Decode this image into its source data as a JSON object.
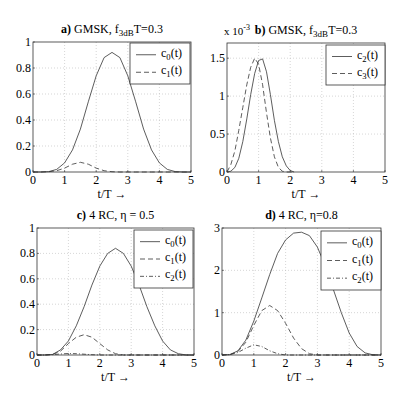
{
  "chart_data": [
    {
      "id": "a",
      "type": "line",
      "title_prefix": "a)",
      "title": "GMSK,  f",
      "title_sub": "3dB",
      "title_suffix": "T=0.3",
      "xlabel": "t/T  →",
      "ylabel": "",
      "xlim": [
        0,
        5
      ],
      "ylim": [
        0,
        1
      ],
      "xticks": [
        0,
        1,
        2,
        3,
        4,
        5
      ],
      "yticks": [
        0,
        0.2,
        0.4,
        0.6,
        0.8,
        1
      ],
      "ytick_labels": [
        "0",
        "0.2",
        "0.4",
        "0.6",
        "0.8",
        "1"
      ],
      "y_multiplier": "",
      "grid": true,
      "legend_position": "upper right",
      "x": [
        0,
        0.25,
        0.5,
        0.75,
        1.0,
        1.25,
        1.5,
        1.75,
        2.0,
        2.25,
        2.5,
        2.75,
        3.0,
        3.25,
        3.5,
        3.75,
        4.0,
        4.25,
        4.5,
        4.75,
        5.0
      ],
      "series": [
        {
          "name": "c",
          "sub": "0",
          "suffix": "(t)",
          "style": "solid",
          "values": [
            0,
            0.0,
            0.003,
            0.02,
            0.07,
            0.17,
            0.33,
            0.54,
            0.74,
            0.88,
            0.92,
            0.88,
            0.74,
            0.54,
            0.33,
            0.17,
            0.07,
            0.02,
            0.003,
            0.0,
            0
          ]
        },
        {
          "name": "c",
          "sub": "1",
          "suffix": "(t)",
          "style": "dashed",
          "values": [
            0,
            0.0,
            0.002,
            0.01,
            0.03,
            0.06,
            0.075,
            0.06,
            0.03,
            0.01,
            0.002,
            0.0,
            0,
            0,
            0,
            0,
            0,
            0,
            0,
            0,
            0
          ]
        }
      ]
    },
    {
      "id": "b",
      "type": "line",
      "title_prefix": "b)",
      "title": "GMSK,  f",
      "title_sub": "3dB",
      "title_suffix": "T=0.3",
      "xlabel": "t/T  →",
      "ylabel": "",
      "xlim": [
        0,
        5
      ],
      "ylim": [
        0,
        1.7
      ],
      "xticks": [
        0,
        1,
        2,
        3,
        4,
        5
      ],
      "yticks": [
        0,
        0.5,
        1,
        1.5
      ],
      "ytick_labels": [
        "0",
        "0.5",
        "1",
        "1.5"
      ],
      "y_multiplier": "x 10",
      "y_multiplier_exp": "-3",
      "grid": true,
      "legend_position": "upper right",
      "x": [
        0,
        0.125,
        0.25,
        0.375,
        0.5,
        0.625,
        0.75,
        0.875,
        1.0,
        1.125,
        1.25,
        1.375,
        1.5,
        1.625,
        1.75,
        1.875,
        2.0,
        2.125
      ],
      "series": [
        {
          "name": "c",
          "sub": "2",
          "suffix": "(t)",
          "style": "solid",
          "values": [
            0,
            0.01,
            0.06,
            0.18,
            0.4,
            0.7,
            1.02,
            1.3,
            1.47,
            1.49,
            1.32,
            1.02,
            0.68,
            0.4,
            0.2,
            0.08,
            0.02,
            0
          ]
        },
        {
          "name": "c",
          "sub": "3",
          "suffix": "(t)",
          "style": "dashed",
          "values": [
            0,
            0.1,
            0.28,
            0.55,
            0.85,
            1.15,
            1.38,
            1.5,
            1.42,
            1.15,
            0.78,
            0.45,
            0.2,
            0.06,
            0.01,
            0,
            0,
            0
          ]
        }
      ]
    },
    {
      "id": "c",
      "type": "line",
      "title_prefix": "c)",
      "title": "4 RC,  η = 0.5",
      "title_sub": "",
      "title_suffix": "",
      "xlabel": "t/T  →",
      "ylabel": "",
      "xlim": [
        0,
        5
      ],
      "ylim": [
        0,
        1
      ],
      "xticks": [
        0,
        1,
        2,
        3,
        4,
        5
      ],
      "yticks": [
        0,
        0.2,
        0.4,
        0.6,
        0.8,
        1
      ],
      "ytick_labels": [
        "0",
        "0.2",
        "0.4",
        "0.6",
        "0.8",
        "1"
      ],
      "y_multiplier": "",
      "grid": true,
      "legend_position": "upper right",
      "x": [
        0,
        0.25,
        0.5,
        0.75,
        1.0,
        1.25,
        1.5,
        1.75,
        2.0,
        2.25,
        2.5,
        2.75,
        3.0,
        3.25,
        3.5,
        3.75,
        4.0,
        4.25,
        4.5,
        4.75,
        5.0
      ],
      "series": [
        {
          "name": "c",
          "sub": "0",
          "suffix": "(t)",
          "style": "solid",
          "values": [
            0,
            0.0,
            0.005,
            0.04,
            0.11,
            0.23,
            0.38,
            0.55,
            0.7,
            0.8,
            0.84,
            0.8,
            0.7,
            0.55,
            0.38,
            0.23,
            0.11,
            0.04,
            0.01,
            0.0,
            0
          ]
        },
        {
          "name": "c",
          "sub": "1",
          "suffix": "(t)",
          "style": "dashed",
          "values": [
            0,
            0.0,
            0.005,
            0.03,
            0.09,
            0.14,
            0.16,
            0.14,
            0.09,
            0.04,
            0.01,
            0.0,
            0,
            0,
            0,
            0,
            0,
            0,
            0,
            0,
            0
          ]
        },
        {
          "name": "c",
          "sub": "2",
          "suffix": "(t)",
          "style": "dashdot",
          "values": [
            0,
            0.0,
            0.003,
            0.008,
            0.012,
            0.01,
            0.006,
            0.002,
            0.0,
            0,
            0,
            0,
            0,
            0,
            0,
            0,
            0,
            0,
            0,
            0,
            0
          ]
        }
      ]
    },
    {
      "id": "d",
      "type": "line",
      "title_prefix": "d)",
      "title": "4 RC,  η=0.8",
      "title_sub": "",
      "title_suffix": "",
      "xlabel": "t/T  →",
      "ylabel": "",
      "xlim": [
        0,
        5
      ],
      "ylim": [
        0,
        3
      ],
      "xticks": [
        0,
        1,
        2,
        3,
        4,
        5
      ],
      "yticks": [
        0,
        1,
        2,
        3
      ],
      "ytick_labels": [
        "0",
        "1",
        "2",
        "3"
      ],
      "y_multiplier": "",
      "grid": true,
      "legend_position": "upper right",
      "x": [
        0,
        0.25,
        0.5,
        0.75,
        1.0,
        1.25,
        1.5,
        1.75,
        2.0,
        2.25,
        2.5,
        2.75,
        3.0,
        3.25,
        3.5,
        3.75,
        4.0,
        4.25,
        4.5,
        4.75,
        5.0
      ],
      "series": [
        {
          "name": "c",
          "sub": "0",
          "suffix": "(t)",
          "style": "solid",
          "values": [
            0,
            0.01,
            0.1,
            0.35,
            0.8,
            1.35,
            1.9,
            2.4,
            2.72,
            2.88,
            2.9,
            2.82,
            2.55,
            2.1,
            1.55,
            1.0,
            0.52,
            0.2,
            0.05,
            0.005,
            0
          ]
        },
        {
          "name": "c",
          "sub": "1",
          "suffix": "(t)",
          "style": "dashed",
          "values": [
            0,
            0.01,
            0.08,
            0.3,
            0.7,
            1.05,
            1.17,
            1.05,
            0.75,
            0.4,
            0.15,
            0.03,
            0.0,
            0,
            0,
            0,
            0,
            0,
            0,
            0,
            0
          ]
        },
        {
          "name": "c",
          "sub": "2",
          "suffix": "(t)",
          "style": "dashdot",
          "values": [
            0,
            0.01,
            0.06,
            0.16,
            0.24,
            0.2,
            0.1,
            0.03,
            0.0,
            0,
            0,
            0,
            0,
            0,
            0,
            0,
            0,
            0,
            0,
            0,
            0
          ]
        }
      ]
    }
  ],
  "layout": {
    "panels": [
      {
        "left": 33,
        "top": 42,
        "right": 191,
        "bottom": 172,
        "legend": {
          "x": 130,
          "y": 43,
          "w": 60,
          "h": 41
        }
      },
      {
        "left": 227,
        "top": 43,
        "right": 385,
        "bottom": 172,
        "legend": {
          "x": 326,
          "y": 45,
          "w": 59,
          "h": 40
        }
      },
      {
        "left": 37,
        "top": 228,
        "right": 194,
        "bottom": 355,
        "legend": {
          "x": 134,
          "y": 230,
          "w": 59,
          "h": 58
        }
      },
      {
        "left": 222,
        "top": 228,
        "right": 381,
        "bottom": 355,
        "legend": {
          "x": 321,
          "y": 231,
          "w": 60,
          "h": 59
        }
      }
    ]
  }
}
